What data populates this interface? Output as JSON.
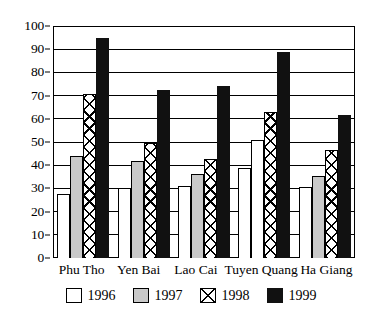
{
  "chart_data": {
    "type": "bar",
    "title": "",
    "xlabel": "",
    "ylabel": "",
    "ylim": [
      0,
      100
    ],
    "ytick_step": 10,
    "yticks": [
      0,
      10,
      20,
      30,
      40,
      50,
      60,
      70,
      80,
      90,
      100
    ],
    "grid": true,
    "legend_position": "bottom",
    "categories": [
      "Phu Tho",
      "Yen Bai",
      "Lao Cai",
      "Tuyen Quang",
      "Ha Giang"
    ],
    "series": [
      {
        "name": "1996",
        "fill": "white",
        "color": "#ffffff",
        "values": [
          27.5,
          30.0,
          31.0,
          39.0,
          30.5
        ]
      },
      {
        "name": "1997",
        "fill": "gray",
        "color": "#c9c9c9",
        "values": [
          44.0,
          42.0,
          36.0,
          51.0,
          35.5
        ]
      },
      {
        "name": "1998",
        "fill": "crosshatch",
        "color": "#ffffff",
        "values": [
          70.5,
          49.5,
          42.5,
          63.0,
          46.5
        ]
      },
      {
        "name": "1999",
        "fill": "black",
        "color": "#111111",
        "values": [
          95.0,
          72.5,
          74.0,
          89.0,
          61.5
        ]
      }
    ],
    "legend": [
      "1996",
      "1997",
      "1998",
      "1999"
    ]
  },
  "axis": {
    "y_labels": [
      "100",
      "90",
      "80",
      "70",
      "60",
      "50",
      "40",
      "30",
      "20",
      "10",
      "0"
    ]
  }
}
